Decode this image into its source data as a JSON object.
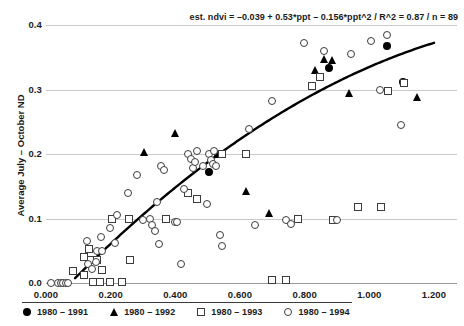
{
  "chart_data": {
    "type": "scatter",
    "title": "",
    "subtitle": "",
    "annotation": "est. ndvi =  –0.039 + 0.53*ppt – 0.156*ppt^2 / R^2 = 0.87 / n = 89",
    "xlabel": "",
    "ylabel": "Average July – October ND",
    "xlim": [
      0.0,
      1.2
    ],
    "ylim": [
      0.0,
      0.4
    ],
    "xticks": [
      0.0,
      0.2,
      0.4,
      0.6,
      0.8,
      1.0,
      1.2
    ],
    "xtick_labels": [
      "0.000",
      "0.200",
      "0.400",
      "0.600",
      "0.800",
      "1.000",
      "1.200"
    ],
    "yticks": [
      0.0,
      0.1,
      0.2,
      0.3,
      0.4
    ],
    "ytick_labels": [
      "0.0",
      "0.1",
      "0.2",
      "0.3",
      "0.4"
    ],
    "grid": true,
    "grid_axis": "y",
    "legend_position": "bottom-left",
    "fit": {
      "kind": "quadratic",
      "equation": "ndvi = -0.039 + 0.53*ppt - 0.156*ppt^2",
      "intercept": -0.039,
      "linear_coef": 0.53,
      "quadratic_coef": -0.156,
      "r_squared": 0.87,
      "n": 89,
      "color": "#000000",
      "x_start": 0.09,
      "x_end": 1.2
    },
    "series": [
      {
        "name": "1980 – 1991",
        "marker": "filled-circle",
        "color": "#000000",
        "points": [
          [
            0.505,
            0.172
          ],
          [
            0.877,
            0.333
          ],
          [
            1.055,
            0.368
          ],
          [
            1.105,
            0.312
          ]
        ]
      },
      {
        "name": "1980 – 1992",
        "marker": "filled-triangle",
        "color": "#000000",
        "points": [
          [
            0.305,
            0.203
          ],
          [
            0.4,
            0.233
          ],
          [
            0.53,
            0.2
          ],
          [
            0.62,
            0.143
          ],
          [
            0.69,
            0.108
          ],
          [
            0.835,
            0.33
          ],
          [
            0.862,
            0.348
          ],
          [
            0.885,
            0.345
          ],
          [
            0.94,
            0.295
          ],
          [
            1.15,
            0.288
          ]
        ]
      },
      {
        "name": "1980 – 1993",
        "marker": "open-square",
        "color": "#3c3c3c",
        "points": [
          [
            0.085,
            0.018
          ],
          [
            0.118,
            0.012
          ],
          [
            0.12,
            0.04
          ],
          [
            0.133,
            0.052
          ],
          [
            0.14,
            0.035
          ],
          [
            0.148,
            0.002
          ],
          [
            0.16,
            0.035
          ],
          [
            0.168,
            0.002
          ],
          [
            0.175,
            0.02
          ],
          [
            0.198,
            0.002
          ],
          [
            0.205,
            0.1
          ],
          [
            0.238,
            0.002
          ],
          [
            0.258,
            0.1
          ],
          [
            0.262,
            0.035
          ],
          [
            0.372,
            0.1
          ],
          [
            0.44,
            0.14
          ],
          [
            0.47,
            0.13
          ],
          [
            0.545,
            0.2
          ],
          [
            0.62,
            0.2
          ],
          [
            0.7,
            0.005
          ],
          [
            0.745,
            0.005
          ],
          [
            0.782,
            0.1
          ],
          [
            0.825,
            0.305
          ],
          [
            0.848,
            0.32
          ],
          [
            0.89,
            0.098
          ],
          [
            0.965,
            0.118
          ],
          [
            1.038,
            0.118
          ],
          [
            1.058,
            0.298
          ],
          [
            1.11,
            0.31
          ]
        ]
      },
      {
        "name": "1980 – 1994",
        "marker": "open-circle",
        "color": "#3c3c3c",
        "points": [
          [
            0.018,
            0.0
          ],
          [
            0.04,
            0.0
          ],
          [
            0.048,
            0.0
          ],
          [
            0.055,
            0.0
          ],
          [
            0.062,
            0.0
          ],
          [
            0.07,
            0.0
          ],
          [
            0.128,
            0.065
          ],
          [
            0.13,
            0.03
          ],
          [
            0.145,
            0.022
          ],
          [
            0.155,
            0.032
          ],
          [
            0.16,
            0.05
          ],
          [
            0.172,
            0.072
          ],
          [
            0.175,
            0.05
          ],
          [
            0.2,
            0.085
          ],
          [
            0.215,
            0.062
          ],
          [
            0.22,
            0.105
          ],
          [
            0.255,
            0.14
          ],
          [
            0.282,
            0.168
          ],
          [
            0.3,
            0.098
          ],
          [
            0.322,
            0.1
          ],
          [
            0.33,
            0.09
          ],
          [
            0.34,
            0.08
          ],
          [
            0.345,
            0.125
          ],
          [
            0.35,
            0.06
          ],
          [
            0.358,
            0.182
          ],
          [
            0.368,
            0.175
          ],
          [
            0.4,
            0.095
          ],
          [
            0.408,
            0.095
          ],
          [
            0.418,
            0.03
          ],
          [
            0.428,
            0.145
          ],
          [
            0.44,
            0.2
          ],
          [
            0.45,
            0.192
          ],
          [
            0.455,
            0.178
          ],
          [
            0.462,
            0.188
          ],
          [
            0.468,
            0.205
          ],
          [
            0.488,
            0.182
          ],
          [
            0.5,
            0.122
          ],
          [
            0.505,
            0.2
          ],
          [
            0.512,
            0.19
          ],
          [
            0.518,
            0.185
          ],
          [
            0.52,
            0.205
          ],
          [
            0.528,
            0.182
          ],
          [
            0.54,
            0.075
          ],
          [
            0.545,
            0.058
          ],
          [
            0.628,
            0.238
          ],
          [
            0.648,
            0.09
          ],
          [
            0.7,
            0.282
          ],
          [
            0.745,
            0.098
          ],
          [
            0.758,
            0.092
          ],
          [
            0.8,
            0.372
          ],
          [
            0.862,
            0.36
          ],
          [
            0.9,
            0.097
          ],
          [
            0.945,
            0.355
          ],
          [
            1.008,
            0.375
          ],
          [
            1.035,
            0.3
          ],
          [
            1.055,
            0.385
          ],
          [
            1.098,
            0.245
          ]
        ]
      }
    ]
  }
}
